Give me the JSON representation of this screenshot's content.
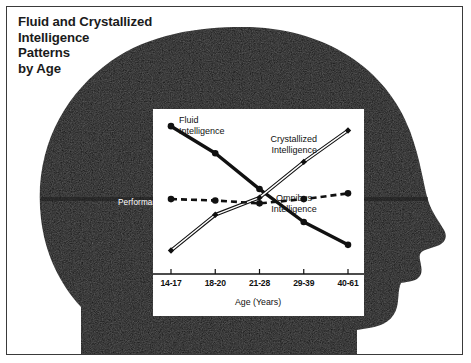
{
  "figure": {
    "title_lines": [
      "Fluid and Crystallized",
      "Intelligence",
      "Patterns",
      "by Age"
    ],
    "background_color": "#ffffff",
    "silhouette_color": "#111111",
    "frame_color": "#3a3a3a"
  },
  "chart_data": {
    "type": "line",
    "title": "Fluid and Crystallized Intelligence Patterns by Age",
    "xlabel": "Age (Years)",
    "ylabel": "Performance",
    "categories": [
      "14-17",
      "18-20",
      "21-28",
      "29-39",
      "40-61"
    ],
    "grid": false,
    "legend": "inline-annotations",
    "ylim": [
      0,
      100
    ],
    "yticks_shown": false,
    "series": [
      {
        "name": "Fluid Intelligence",
        "label": "Fluid\nIntelligence",
        "line_style": "solid-thick",
        "marker": "filled-circle",
        "color": "#111111",
        "values": [
          95,
          76,
          51,
          28,
          12
        ]
      },
      {
        "name": "Crystallized Intelligence",
        "label": "Crystallized\nIntelligence",
        "line_style": "double-outline",
        "marker": "filled-diamond",
        "color": "#111111",
        "values": [
          8,
          33,
          45,
          70,
          92
        ]
      },
      {
        "name": "Omnibus Intelligence",
        "label": "Omnibus\nIntelligence",
        "line_style": "dashed",
        "marker": "filled-circle",
        "color": "#111111",
        "values": [
          44,
          43,
          41,
          44,
          48
        ]
      }
    ]
  }
}
